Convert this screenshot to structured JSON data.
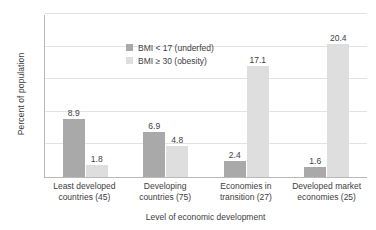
{
  "chart_data": {
    "type": "bar",
    "title": "",
    "xlabel": "Level of economic development",
    "ylabel": "Percent of population",
    "ylim": [
      0,
      25
    ],
    "yticks": [
      0,
      5,
      10,
      15,
      20,
      25
    ],
    "ytick_labels": [
      "0",
      "5",
      "10",
      "15",
      "20",
      "25"
    ],
    "grid": true,
    "legend_position": "upper-center-left inside plot",
    "categories": [
      "Least developed countries (45)",
      "Developing countries (75)",
      "Economies in transition (27)",
      "Developed market economies (25)"
    ],
    "category_lines": [
      [
        "Least developed",
        "countries (45)"
      ],
      [
        "Developing",
        "countries (75)"
      ],
      [
        "Economies in",
        "transition (27)"
      ],
      [
        "Developed market",
        "economies (25)"
      ]
    ],
    "series": [
      {
        "name": "BMI < 17 (underfed)",
        "color": "#a9a9a9",
        "values": [
          8.9,
          6.9,
          2.4,
          1.6
        ],
        "labels": [
          "8.9",
          "6.9",
          "2.4",
          "1.6"
        ]
      },
      {
        "name": "BMI ≥ 30 (obesity)",
        "color": "#dedede",
        "values": [
          1.8,
          4.8,
          17.1,
          20.4
        ],
        "labels": [
          "1.8",
          "4.8",
          "17.1",
          "20.4"
        ]
      }
    ]
  }
}
